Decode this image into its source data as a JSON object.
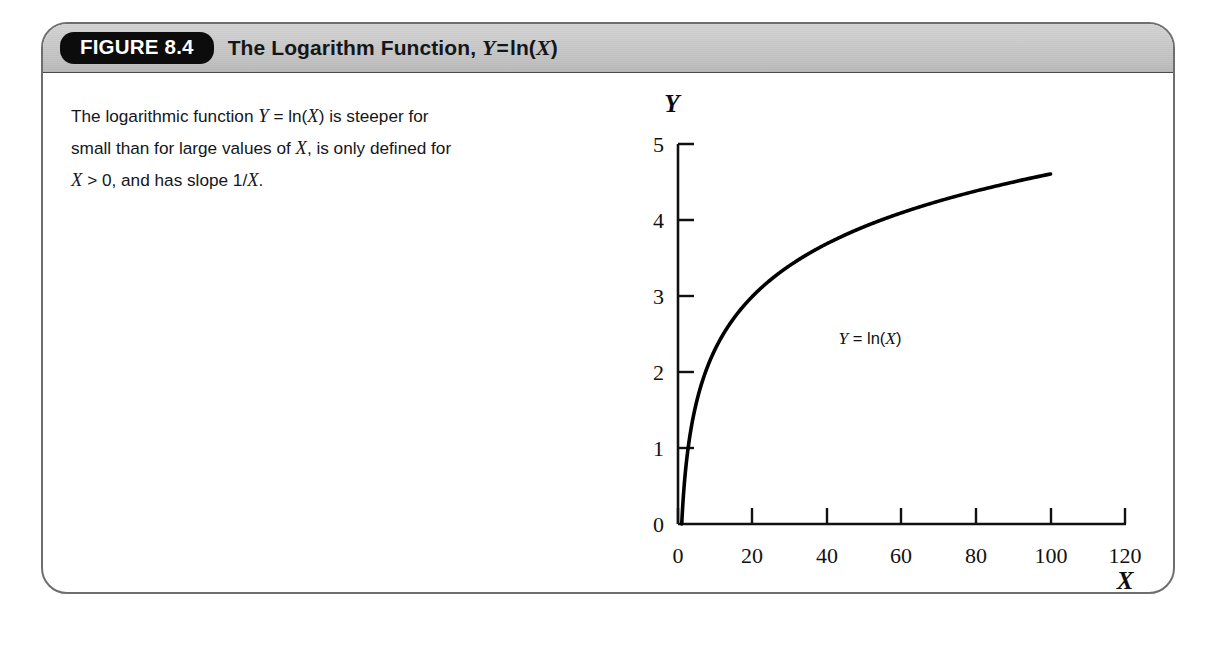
{
  "figure": {
    "badge_label": "FIGURE 8.4",
    "title_prefix": "The Logarithm Function,",
    "title_var_y": "Y",
    "title_equals": "=",
    "title_func": "ln(",
    "title_var_x": "X",
    "title_close": ")",
    "caption_line1_a": "The logarithmic function",
    "caption_line1_y": "Y",
    "caption_line1_eq": "=",
    "caption_line1_ln": "ln(",
    "caption_line1_x": "X",
    "caption_line1_b": ") is steeper for",
    "caption_line2_a": "small than for large values of",
    "caption_line2_x": "X",
    "caption_line2_b": ", is only defined for",
    "caption_line3_x": "X",
    "caption_line3_a": "> 0, and has slope 1/",
    "caption_line3_x2": "X",
    "caption_line3_b": "."
  },
  "colors": {
    "border": "#6e6e6e",
    "header_band": "#c9c9c9",
    "badge_bg": "#0c0c0c",
    "badge_text": "#ffffff",
    "curve": "#000000",
    "axis": "#111111",
    "text": "#14161a",
    "page_bg": "#ffffff"
  },
  "chart_data": {
    "type": "line",
    "xlabel": "X",
    "ylabel": "Y",
    "xlim": [
      0,
      120
    ],
    "ylim": [
      0,
      5
    ],
    "xticks": [
      0,
      20,
      40,
      60,
      80,
      100,
      120
    ],
    "xtick_labels": [
      "0",
      "20",
      "40",
      "60",
      "80",
      "100",
      "120"
    ],
    "yticks": [
      0,
      1,
      2,
      3,
      4,
      5
    ],
    "ytick_labels": [
      "0",
      "1",
      "2",
      "3",
      "4",
      "5"
    ],
    "grid": false,
    "legend": "none",
    "annotations": [
      {
        "text": "Y = ln(X)",
        "x": 52,
        "y": 3.45
      }
    ],
    "series": [
      {
        "name": "Y = ln(X)",
        "x": [
          1,
          2,
          3,
          4,
          5,
          6,
          8,
          10,
          12,
          15,
          18,
          20,
          25,
          30,
          35,
          40,
          45,
          50,
          55,
          60,
          65,
          70,
          75,
          80,
          85,
          90,
          95,
          100
        ],
        "y": [
          0.0,
          0.69,
          1.1,
          1.39,
          1.61,
          1.79,
          2.08,
          2.3,
          2.48,
          2.71,
          2.89,
          3.0,
          3.22,
          3.4,
          3.56,
          3.69,
          3.81,
          3.91,
          4.01,
          4.09,
          4.17,
          4.25,
          4.32,
          4.38,
          4.44,
          4.5,
          4.55,
          4.61
        ]
      }
    ]
  }
}
